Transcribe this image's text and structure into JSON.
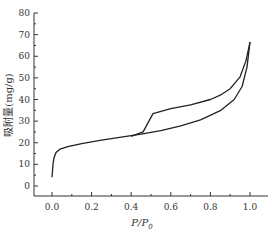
{
  "chart_data": {
    "type": "line",
    "title": "",
    "xlabel": "P/P0",
    "xlabel_main": "P/P",
    "xlabel_sub": "0",
    "ylabel": "吸附量(mg/g)",
    "xlim": [
      -0.08,
      1.1
    ],
    "ylim": [
      -3,
      80
    ],
    "xticks": [
      0.0,
      0.2,
      0.4,
      0.6,
      0.8,
      1.0
    ],
    "xtick_labels": [
      "0.0",
      "0.2",
      "0.4",
      "0.6",
      "0.8",
      "1.0"
    ],
    "yticks": [
      0,
      10,
      20,
      30,
      40,
      50,
      60,
      70,
      80
    ],
    "ytick_labels": [
      "0",
      "10",
      "20",
      "30",
      "40",
      "50",
      "60",
      "70",
      "80"
    ],
    "grid": false,
    "legend": null,
    "series": [
      {
        "name": "adsorption",
        "x": [
          0.0,
          0.005,
          0.01,
          0.02,
          0.04,
          0.08,
          0.15,
          0.25,
          0.35,
          0.45,
          0.55,
          0.65,
          0.75,
          0.85,
          0.92,
          0.96,
          0.985,
          1.0
        ],
        "y": [
          4,
          10,
          13,
          15.5,
          17,
          18.2,
          19.6,
          21.2,
          22.6,
          24,
          25.6,
          27.8,
          30.6,
          34.8,
          40,
          46,
          55,
          66.5
        ]
      },
      {
        "name": "desorption",
        "x": [
          1.0,
          0.98,
          0.95,
          0.9,
          0.85,
          0.8,
          0.7,
          0.6,
          0.51,
          0.46,
          0.4
        ],
        "y": [
          66.5,
          58,
          50.5,
          45,
          42,
          40,
          37.5,
          35.8,
          33.5,
          25,
          23
        ]
      }
    ]
  }
}
